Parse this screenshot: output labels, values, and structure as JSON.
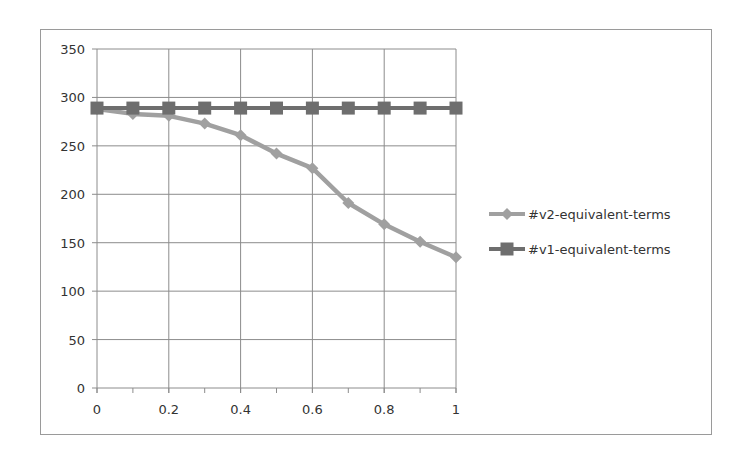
{
  "chart_data": {
    "type": "line",
    "title": "",
    "xlabel": "",
    "ylabel": "",
    "x": [
      0,
      0.1,
      0.2,
      0.3,
      0.4,
      0.5,
      0.6,
      0.7,
      0.8,
      0.9,
      1.0
    ],
    "xlim": [
      0,
      1
    ],
    "ylim": [
      0,
      350
    ],
    "xticks": [
      "0",
      "0.2",
      "0.4",
      "0.6",
      "0.8",
      "1"
    ],
    "yticks": [
      "0",
      "50",
      "100",
      "150",
      "200",
      "250",
      "300",
      "350"
    ],
    "grid": true,
    "legend_position": "right",
    "series": [
      {
        "name": "#v2-equivalent-terms",
        "marker": "diamond",
        "color": "#a0a0a0",
        "values": [
          288,
          283,
          281,
          273,
          261,
          242,
          227,
          191,
          169,
          151,
          135
        ]
      },
      {
        "name": "#v1-equivalent-terms",
        "marker": "square",
        "color": "#6e6e6e",
        "values": [
          289,
          289,
          289,
          289,
          289,
          289,
          289,
          289,
          289,
          289,
          289
        ]
      }
    ]
  }
}
